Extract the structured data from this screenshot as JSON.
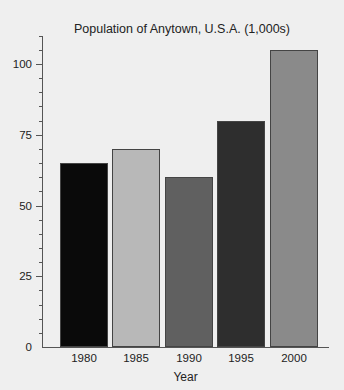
{
  "chart_data": {
    "type": "bar",
    "title": "Population of Anytown, U.S.A. (1,000s)",
    "xlabel": "Year",
    "ylabel": "",
    "categories": [
      "1980",
      "1985",
      "1990",
      "1995",
      "2000"
    ],
    "values": [
      65,
      70,
      60,
      80,
      105
    ],
    "colors": [
      "#0a0a0a",
      "#b8b8b8",
      "#606060",
      "#2e2e2e",
      "#8a8a8a"
    ],
    "ylim": [
      0,
      110
    ],
    "yticks_major": [
      0,
      25,
      50,
      75,
      100
    ],
    "yticks_minor_step": 5,
    "grid": false,
    "legend": null
  }
}
